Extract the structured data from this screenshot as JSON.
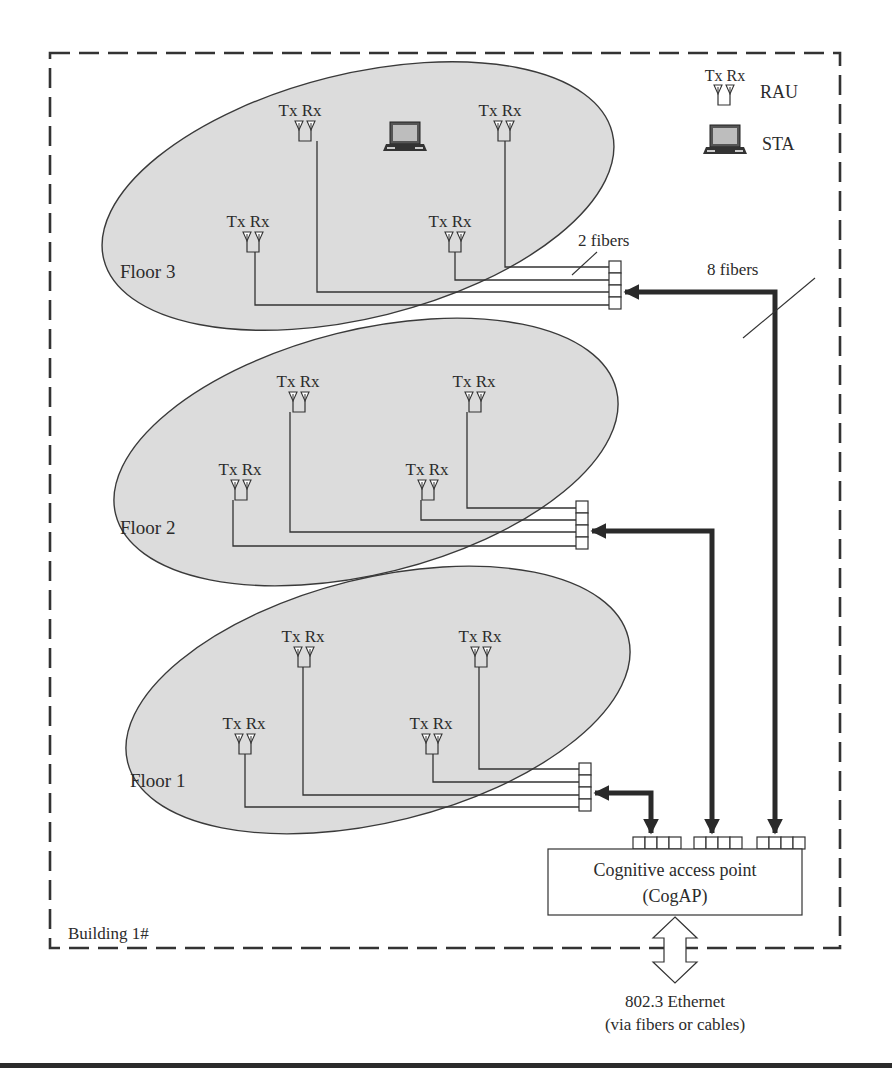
{
  "legend": {
    "rau_antenna_labels": "Tx Rx",
    "rau_label": "RAU",
    "sta_label": "STA"
  },
  "building": {
    "label": "Building 1#"
  },
  "floors": [
    {
      "name": "Floor 3",
      "raus": [
        {
          "label": "Tx Rx",
          "x": 300,
          "y": 132
        },
        {
          "label": "Tx Rx",
          "x": 490,
          "y": 132
        },
        {
          "label": "Tx Rx",
          "x": 245,
          "y": 221
        },
        {
          "label": "Tx Rx",
          "x": 448,
          "y": 221
        }
      ],
      "has_sta": true
    },
    {
      "name": "Floor 2",
      "raus": [
        {
          "label": "Tx Rx",
          "x": 296,
          "y": 382
        },
        {
          "label": "Tx Rx",
          "x": 473,
          "y": 382
        },
        {
          "label": "Tx Rx",
          "x": 240,
          "y": 470
        },
        {
          "label": "Tx Rx",
          "x": 427,
          "y": 470
        }
      ],
      "has_sta": false
    },
    {
      "name": "Floor 1",
      "raus": [
        {
          "label": "Tx Rx",
          "x": 302,
          "y": 638
        },
        {
          "label": "Tx Rx",
          "x": 479,
          "y": 638
        },
        {
          "label": "Tx Rx",
          "x": 243,
          "y": 725
        },
        {
          "label": "Tx Rx",
          "x": 430,
          "y": 725
        }
      ],
      "has_sta": false
    }
  ],
  "annotations": {
    "two_fibers": "2 fibers",
    "eight_fibers": "8 fibers"
  },
  "cogap": {
    "line1": "Cognitive access point",
    "line2": "(CogAP)"
  },
  "ethernet": {
    "line1": "802.3 Ethernet",
    "line2": "(via fibers or cables)"
  },
  "colors": {
    "floor_fill": "#dcdcdc",
    "stroke": "#333333",
    "background": "#ffffff"
  }
}
